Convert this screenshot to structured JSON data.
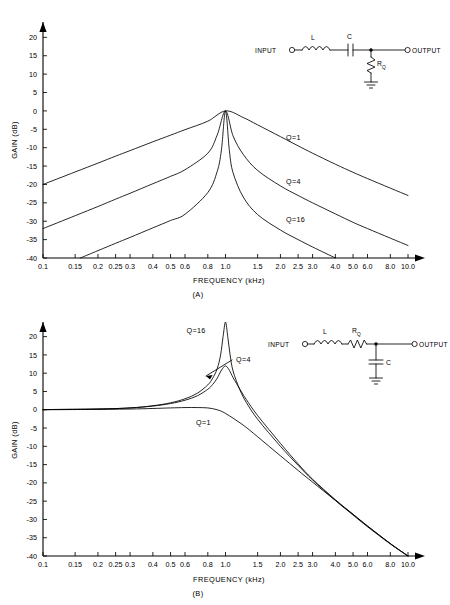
{
  "figure": {
    "panels": [
      {
        "id": "A",
        "caption": "(A)",
        "xlabel": "FREQUENCY (kHz)",
        "ylabel": "GAIN (dB)",
        "circuit": {
          "input_label": "INPUT",
          "output_label": "OUTPUT",
          "components": [
            "L",
            "C",
            "R"
          ],
          "series_inductor": "L",
          "series_capacitor": "C",
          "shunt_resistor": "R",
          "shunt_resistor_sub": "Q",
          "ground": "ground-symbol"
        },
        "curve_labels": [
          "Q=1",
          "Q=4",
          "Q=16"
        ]
      },
      {
        "id": "B",
        "caption": "(B)",
        "xlabel": "FREQUENCY (kHz)",
        "ylabel": "GAIN (dB)",
        "circuit": {
          "input_label": "INPUT",
          "output_label": "OUTPUT",
          "components": [
            "L",
            "R",
            "C"
          ],
          "series_inductor": "L",
          "series_resistor": "R",
          "series_resistor_sub": "Q",
          "shunt_capacitor": "C",
          "ground": "ground-symbol"
        },
        "curve_labels": [
          "Q=16",
          "Q=4",
          "Q=1"
        ]
      }
    ]
  },
  "chart_data": [
    {
      "type": "line",
      "title": "(A) Bandpass response — series LC with shunt R_Q",
      "xlabel": "FREQUENCY (kHz)",
      "ylabel": "GAIN (dB)",
      "xscale": "log",
      "xlim": [
        0.1,
        10.0
      ],
      "ylim": [
        -40,
        22
      ],
      "grid": false,
      "legend": "inline-curve-labels",
      "xticks": [
        0.1,
        0.15,
        0.2,
        0.25,
        0.3,
        0.4,
        0.5,
        0.6,
        0.8,
        1.0,
        1.5,
        2.0,
        2.5,
        3.0,
        4.0,
        5.0,
        6.0,
        8.0,
        10.0
      ],
      "xticklabels": [
        "0.1",
        "0.15",
        "0.2",
        "0.25",
        "0.3",
        "0.4",
        "0.5",
        "0.6",
        "0.8",
        "1.0",
        "1.5",
        "2.0",
        "2.5",
        "3.0",
        "4.0",
        "5.0",
        "6.0",
        "8.0",
        "10.0"
      ],
      "yticks": [
        20,
        15,
        10,
        5,
        0,
        -5,
        -10,
        -15,
        -20,
        -25,
        -30,
        -35,
        -40
      ],
      "yticklabels": [
        "20",
        "15",
        "10",
        "5",
        "0",
        "-5",
        "-10",
        "-15",
        "-20",
        "-25",
        "-30",
        "-35",
        "-40"
      ],
      "center_frequency_khz": 1.0,
      "peak_gain_db": 0,
      "series": [
        {
          "name": "Q=1",
          "x": [
            0.1,
            0.15,
            0.2,
            0.25,
            0.3,
            0.4,
            0.5,
            0.6,
            0.8,
            1.0,
            1.25,
            1.5,
            2.0,
            2.5,
            3.0,
            4.0,
            5.0,
            6.0,
            8.0,
            10.0
          ],
          "y": [
            -20.0,
            -16.6,
            -14.2,
            -12.3,
            -10.8,
            -8.4,
            -6.6,
            -5.1,
            -2.8,
            0.0,
            -1.8,
            -3.8,
            -7.0,
            -9.5,
            -11.5,
            -14.5,
            -16.7,
            -18.4,
            -21.0,
            -23.0
          ]
        },
        {
          "name": "Q=4",
          "x": [
            0.1,
            0.15,
            0.2,
            0.25,
            0.3,
            0.4,
            0.5,
            0.6,
            0.8,
            0.9,
            1.0,
            1.1,
            1.25,
            1.5,
            2.0,
            2.5,
            3.0,
            4.0,
            5.0,
            6.0,
            8.0,
            10.0
          ],
          "y": [
            -32.0,
            -28.5,
            -26.0,
            -24.0,
            -22.4,
            -19.8,
            -17.8,
            -16.0,
            -11.5,
            -6.6,
            0.0,
            -6.8,
            -11.8,
            -16.2,
            -20.4,
            -23.0,
            -25.0,
            -28.0,
            -30.3,
            -32.0,
            -34.6,
            -36.6
          ]
        },
        {
          "name": "Q=16",
          "x": [
            0.16,
            0.2,
            0.25,
            0.3,
            0.4,
            0.5,
            0.6,
            0.8,
            0.9,
            0.95,
            1.0,
            1.05,
            1.1,
            1.25,
            1.5,
            2.0,
            2.5,
            3.0,
            4.0,
            5.0,
            6.0
          ],
          "y": [
            -40.0,
            -38.0,
            -36.0,
            -34.4,
            -31.8,
            -29.8,
            -28.1,
            -22.2,
            -16.5,
            -10.6,
            0.0,
            -10.8,
            -16.8,
            -23.4,
            -28.2,
            -32.4,
            -35.0,
            -37.0,
            -40.0,
            -42.3,
            -44.0
          ]
        }
      ]
    },
    {
      "type": "line",
      "title": "(B) Lowpass response — series LR_Q with shunt C",
      "xlabel": "FREQUENCY (kHz)",
      "ylabel": "GAIN (dB)",
      "xscale": "log",
      "xlim": [
        0.1,
        10.0
      ],
      "ylim": [
        -40,
        24
      ],
      "grid": false,
      "legend": "inline-curve-labels",
      "xticks": [
        0.1,
        0.15,
        0.2,
        0.25,
        0.3,
        0.4,
        0.5,
        0.6,
        0.8,
        1.0,
        1.5,
        2.0,
        2.5,
        3.0,
        4.0,
        5.0,
        6.0,
        8.0,
        10.0
      ],
      "xticklabels": [
        "0.1",
        "0.15",
        "0.2",
        "0.25",
        "0.3",
        "0.4",
        "0.5",
        "0.6",
        "0.8",
        "1.0",
        "1.5",
        "2.0",
        "2.5",
        "3.0",
        "4.0",
        "5.0",
        "6.0",
        "8.0",
        "10.0"
      ],
      "yticks": [
        20,
        15,
        10,
        5,
        0,
        -5,
        -10,
        -15,
        -20,
        -25,
        -30,
        -35,
        -40
      ],
      "yticklabels": [
        "20",
        "15",
        "10",
        "5",
        "0",
        "-5",
        "-10",
        "-15",
        "-20",
        "-25",
        "-30",
        "-35",
        "-40"
      ],
      "cutoff_frequency_khz": 1.0,
      "peaks": [
        {
          "name": "Q=16",
          "x": 1.0,
          "y": 24
        },
        {
          "name": "Q=4",
          "x": 1.0,
          "y": 12
        },
        {
          "name": "Q=1",
          "x": 0.78,
          "y": 0.6
        }
      ],
      "series": [
        {
          "name": "Q=1",
          "x": [
            0.1,
            0.2,
            0.3,
            0.4,
            0.5,
            0.6,
            0.7,
            0.8,
            0.9,
            1.0,
            1.25,
            1.5,
            2.0,
            2.5,
            3.0,
            4.0,
            5.0,
            6.0,
            8.0,
            10.0
          ],
          "y": [
            0.0,
            0.1,
            0.2,
            0.35,
            0.5,
            0.6,
            0.6,
            0.5,
            0.0,
            -1.0,
            -4.2,
            -7.4,
            -12.6,
            -16.6,
            -19.8,
            -24.8,
            -28.6,
            -31.8,
            -36.6,
            -40.0
          ]
        },
        {
          "name": "Q=4",
          "x": [
            0.1,
            0.2,
            0.3,
            0.4,
            0.5,
            0.6,
            0.7,
            0.8,
            0.85,
            0.9,
            0.95,
            1.0,
            1.05,
            1.1,
            1.2,
            1.3,
            1.5,
            2.0,
            2.5,
            3.0,
            4.0,
            5.0,
            6.0,
            8.0,
            10.0
          ],
          "y": [
            0.05,
            0.2,
            0.5,
            1.0,
            1.7,
            2.6,
            3.8,
            5.6,
            6.9,
            8.6,
            10.8,
            12.0,
            10.8,
            8.8,
            5.6,
            2.8,
            -1.6,
            -9.2,
            -14.8,
            -19.0,
            -24.6,
            -28.6,
            -31.8,
            -36.6,
            -40.0
          ]
        },
        {
          "name": "Q=16",
          "x": [
            0.1,
            0.2,
            0.3,
            0.4,
            0.5,
            0.6,
            0.7,
            0.8,
            0.85,
            0.9,
            0.94,
            0.97,
            1.0,
            1.03,
            1.06,
            1.1,
            1.2,
            1.3,
            1.5,
            2.0,
            2.5,
            3.0,
            4.0,
            5.0,
            6.0,
            8.0,
            10.0
          ],
          "y": [
            0.05,
            0.2,
            0.5,
            1.1,
            1.9,
            3.0,
            4.5,
            6.8,
            8.6,
            11.2,
            15.0,
            20.0,
            24.0,
            19.8,
            15.0,
            10.6,
            5.4,
            2.0,
            -2.6,
            -10.0,
            -15.2,
            -19.2,
            -24.8,
            -28.8,
            -32.0,
            -36.7,
            -40.0
          ]
        }
      ]
    }
  ]
}
